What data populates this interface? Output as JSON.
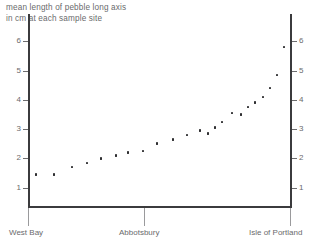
{
  "chart_data": {
    "type": "scatter",
    "title": "mean length of pebble long axis in cm at each sample site",
    "title_lines": [
      "mean length of pebble long axis",
      "in cm at each sample site"
    ],
    "xlabel": "",
    "ylabel": "mean length of pebble long axis in cm",
    "ylim": [
      0,
      6.6
    ],
    "yticks": [
      1,
      2,
      3,
      4,
      5,
      6
    ],
    "ytick_labels": [
      "1",
      "2",
      "3",
      "4",
      "5",
      "6"
    ],
    "right_axis_yticks": [
      1,
      2,
      3,
      4,
      5,
      6
    ],
    "right_axis_ytick_labels": [
      "1",
      "2",
      "3",
      "4",
      "5",
      "6"
    ],
    "grid": false,
    "legend": false,
    "x_site_markers": [
      {
        "label": "West Bay",
        "x_px": 28
      },
      {
        "label": "Abbotsbury",
        "x_px": 144
      },
      {
        "label": "Isle of Portland",
        "x_px": 290
      }
    ],
    "x": [
      36,
      54,
      72,
      87,
      101,
      116,
      128,
      143,
      157,
      173,
      187,
      200,
      208,
      215,
      222,
      232,
      241,
      248,
      255,
      263,
      270,
      277,
      284
    ],
    "values": [
      1.45,
      1.45,
      1.7,
      1.85,
      2.0,
      2.1,
      2.2,
      2.25,
      2.5,
      2.65,
      2.8,
      2.95,
      2.85,
      3.05,
      3.25,
      3.55,
      3.5,
      3.75,
      3.9,
      4.1,
      4.4,
      4.85,
      5.8
    ],
    "n_points": 23
  }
}
